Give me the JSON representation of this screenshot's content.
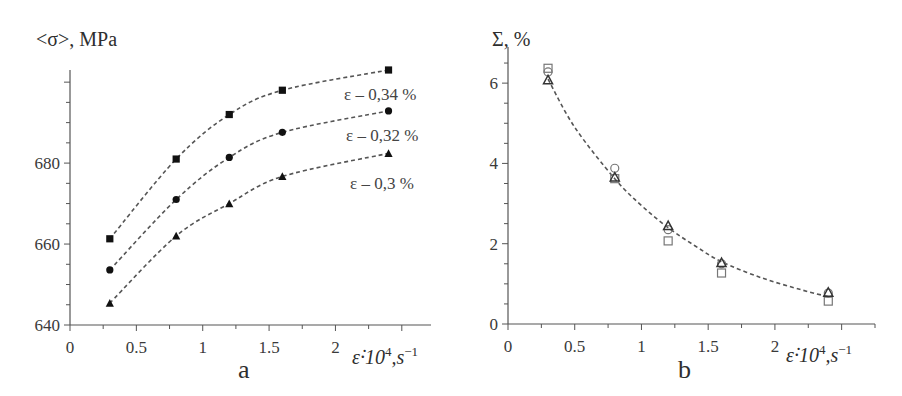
{
  "chart_data": [
    {
      "panel": "a",
      "type": "scatter",
      "title": "",
      "panel_label": "a",
      "xlabel": "ε̇·10⁴, s⁻¹",
      "ylabel": "<σ>, MPa",
      "xlim": [
        0,
        2.72
      ],
      "ylim": [
        640,
        703
      ],
      "xticks": [
        0,
        0.5,
        1,
        1.5,
        2
      ],
      "xtick_labels": [
        "0",
        "0.5",
        "1",
        "1.5",
        "2"
      ],
      "yticks": [
        640,
        660,
        680,
        700
      ],
      "ytick_labels": [
        "640",
        "660",
        "680",
        ""
      ],
      "grid": false,
      "legend": "inline labels at right end of curves",
      "x": [
        0.3,
        0.8,
        1.2,
        1.6,
        2.4
      ],
      "series": [
        {
          "name": "ε – 0,34 %",
          "marker": "filled-square",
          "values": [
            661.3,
            681.0,
            692.0,
            698.0,
            703.0
          ]
        },
        {
          "name": "ε – 0,32 %",
          "marker": "filled-circle",
          "values": [
            653.6,
            671.0,
            681.4,
            687.6,
            692.9
          ]
        },
        {
          "name": "ε – 0,3 %",
          "marker": "filled-triangle",
          "values": [
            645.4,
            662.0,
            670.0,
            676.7,
            682.4
          ]
        }
      ],
      "fit": "dashed exponential-saturation curve per series"
    },
    {
      "panel": "b",
      "type": "scatter",
      "title": "",
      "panel_label": "b",
      "xlabel": "ε̇·10⁴, s⁻¹",
      "ylabel": "Σ, %",
      "xlim": [
        0,
        2.75
      ],
      "ylim": [
        0,
        6.9
      ],
      "xticks": [
        0,
        0.5,
        1,
        1.5,
        2
      ],
      "xtick_labels": [
        "0",
        "0.5",
        "1",
        "1.5",
        "2"
      ],
      "yticks": [
        0,
        2,
        4,
        6
      ],
      "ytick_labels": [
        "0",
        "2",
        "4",
        "6"
      ],
      "grid": false,
      "x": [
        0.3,
        0.8,
        1.2,
        1.6,
        2.4
      ],
      "series": [
        {
          "name": "open-square",
          "marker": "open-square",
          "values": [
            6.37,
            3.62,
            2.07,
            1.27,
            0.57
          ]
        },
        {
          "name": "open-circle",
          "marker": "open-circle",
          "values": [
            6.28,
            3.88,
            2.35,
            1.5,
            0.77
          ]
        },
        {
          "name": "open-triangle",
          "marker": "open-triangle",
          "values": [
            6.07,
            3.65,
            2.44,
            1.52,
            0.78
          ]
        }
      ],
      "fit_curve": {
        "x": [
          0.3,
          0.5,
          0.8,
          1.0,
          1.2,
          1.4,
          1.6,
          1.9,
          2.2,
          2.4
        ],
        "values": [
          6.1,
          4.9,
          3.62,
          2.95,
          2.4,
          1.95,
          1.55,
          1.15,
          0.85,
          0.68
        ]
      }
    }
  ],
  "figure": {
    "panel_a": {
      "ylabel": "<σ>, MPa",
      "panel_label": "a",
      "xlabel_main": "ε̇·10",
      "xlabel_sup": "4",
      "xlabel_unit": ",s",
      "xlabel_unit_sup": "−1",
      "curve_labels": [
        "ε – 0,34 %",
        "ε – 0,32 %",
        "ε – 0,3 %"
      ]
    },
    "panel_b": {
      "ylabel": "Σ, %",
      "panel_label": "b",
      "xlabel_main": "ε̇·10",
      "xlabel_sup": "4",
      "xlabel_unit": ",s",
      "xlabel_unit_sup": "−1"
    }
  }
}
